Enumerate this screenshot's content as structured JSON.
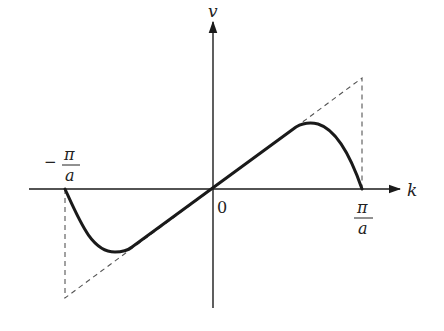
{
  "diagram": {
    "axes": {
      "x_label": "k",
      "y_label": "v",
      "origin_label": "0"
    },
    "tick_labels": {
      "left": {
        "sign": "−",
        "numerator": "π",
        "denominator": "a"
      },
      "right": {
        "numerator": "π",
        "denominator": "a"
      }
    },
    "curves": [
      {
        "name": "group-velocity-curve",
        "style": "solid-thick",
        "description": "v(k): linear near 0, peaks near 0.7π/a, returns to 0 at ±π/a"
      },
      {
        "name": "linear-approximation",
        "style": "dashed",
        "description": "straight line v ∝ k extended to ±π/a with vertical drops at zone edges"
      }
    ],
    "colors": {
      "stroke": "#1a1a1a",
      "dashed": "#555555",
      "background": "#ffffff"
    }
  }
}
